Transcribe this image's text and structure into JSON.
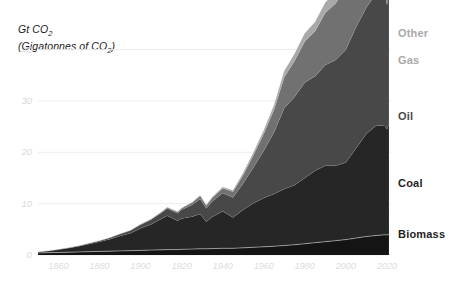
{
  "chart_data": {
    "type": "area",
    "stacked": true,
    "title": "",
    "ylabel": "Gt CO2 (Gigatonnes of CO2)",
    "ylabel_line1": "Gt CO",
    "ylabel_line1_sub": "2",
    "ylabel_line2_open": "(Gigatonnes of CO",
    "ylabel_line2_sub": "2",
    "ylabel_line2_close": ")",
    "xlabel": "",
    "xlim": [
      1850,
      2022
    ],
    "ylim": [
      0,
      45
    ],
    "yticks": [
      0,
      10,
      20,
      30,
      40
    ],
    "ytick_labels": [
      "0",
      "10",
      "20",
      "30",
      "40"
    ],
    "xticks": [
      1860,
      1880,
      1900,
      1920,
      1940,
      1960,
      1980,
      2000,
      2020
    ],
    "xtick_labels": [
      "1860",
      "1880",
      "1900",
      "1920",
      "1940",
      "1960",
      "1980",
      "2000",
      "2020"
    ],
    "grid": true,
    "grid_axis": "y",
    "legend_position": "right-inline",
    "x": [
      1850,
      1855,
      1860,
      1865,
      1870,
      1875,
      1880,
      1885,
      1890,
      1895,
      1900,
      1905,
      1910,
      1913,
      1918,
      1920,
      1925,
      1929,
      1932,
      1935,
      1940,
      1945,
      1950,
      1955,
      1960,
      1965,
      1970,
      1975,
      1980,
      1985,
      1990,
      1995,
      2000,
      2005,
      2010,
      2015,
      2019,
      2020,
      2021
    ],
    "series": [
      {
        "name": "Biomass",
        "color": "#141414",
        "values": [
          0.4,
          0.45,
          0.5,
          0.55,
          0.6,
          0.65,
          0.7,
          0.75,
          0.8,
          0.85,
          0.9,
          0.95,
          1.0,
          1.05,
          1.05,
          1.1,
          1.15,
          1.2,
          1.2,
          1.25,
          1.3,
          1.3,
          1.4,
          1.5,
          1.6,
          1.7,
          1.85,
          2.0,
          2.2,
          2.4,
          2.6,
          2.8,
          3.0,
          3.3,
          3.6,
          3.8,
          3.95,
          3.9,
          4.0
        ]
      },
      {
        "name": "Coal",
        "color": "#262626",
        "values": [
          0.2,
          0.35,
          0.55,
          0.8,
          1.1,
          1.5,
          1.9,
          2.3,
          2.9,
          3.4,
          4.3,
          5.0,
          6.0,
          6.6,
          5.6,
          6.0,
          6.3,
          6.8,
          5.3,
          6.2,
          7.2,
          6.0,
          7.4,
          8.6,
          9.5,
          10.2,
          11.0,
          11.6,
          12.8,
          14.0,
          14.8,
          14.6,
          15.0,
          17.5,
          20.0,
          21.5,
          21.2,
          20.6,
          21.4
        ]
      },
      {
        "name": "Oil",
        "color": "#484848",
        "values": [
          0.0,
          0.0,
          0.02,
          0.05,
          0.1,
          0.15,
          0.2,
          0.3,
          0.4,
          0.5,
          0.7,
          0.9,
          1.2,
          1.4,
          1.5,
          1.7,
          2.3,
          2.9,
          2.6,
          3.0,
          3.6,
          3.9,
          5.2,
          7.0,
          9.2,
          12.0,
          15.8,
          17.2,
          18.6,
          18.4,
          19.6,
          20.6,
          22.0,
          23.6,
          24.6,
          25.8,
          26.4,
          24.2,
          25.6
        ]
      },
      {
        "name": "Gas",
        "color": "#717171",
        "values": [
          0.0,
          0.0,
          0.0,
          0.0,
          0.0,
          0.0,
          0.0,
          0.0,
          0.02,
          0.04,
          0.07,
          0.1,
          0.15,
          0.2,
          0.25,
          0.3,
          0.45,
          0.6,
          0.55,
          0.7,
          0.9,
          1.1,
          1.6,
          2.4,
          3.3,
          4.4,
          6.0,
          7.0,
          8.0,
          8.8,
          10.2,
          11.0,
          12.2,
          13.6,
          15.0,
          16.2,
          17.4,
          17.0,
          17.8
        ]
      },
      {
        "name": "Other",
        "color": "#a9a9a9",
        "values": [
          0.0,
          0.0,
          0.0,
          0.0,
          0.0,
          0.0,
          0.0,
          0.0,
          0.0,
          0.0,
          0.01,
          0.02,
          0.03,
          0.04,
          0.05,
          0.06,
          0.1,
          0.15,
          0.15,
          0.2,
          0.25,
          0.3,
          0.4,
          0.5,
          0.7,
          0.9,
          1.2,
          1.4,
          1.6,
          1.8,
          2.0,
          2.2,
          2.5,
          2.8,
          3.1,
          3.4,
          3.6,
          3.5,
          3.7
        ]
      }
    ]
  },
  "series_labels": [
    {
      "name": "Other",
      "color": "#a9a9a9",
      "top": 27,
      "left": 398
    },
    {
      "name": "Gas",
      "color": "#a9a9a9",
      "top": 54,
      "left": 398
    },
    {
      "name": "Oil",
      "color": "#4a4a4a",
      "top": 110,
      "left": 398
    },
    {
      "name": "Coal",
      "color": "#1f1f1f",
      "top": 177,
      "left": 398
    },
    {
      "name": "Biomass",
      "color": "#1f1f1f",
      "top": 228,
      "left": 398
    }
  ],
  "colors": {
    "background": "#ffffff",
    "gridline": "#ededed",
    "ytick_text": "#d8d8d8",
    "xtick_text": "#dcdcdc",
    "axis_title_text": "#1a1a1a"
  }
}
